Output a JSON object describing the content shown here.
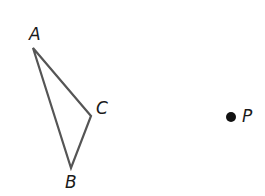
{
  "diagram": {
    "type": "geometry",
    "triangle": {
      "name": "triangle-ABC",
      "vertices": [
        {
          "label": "A",
          "x": 33,
          "y": 48
        },
        {
          "label": "B",
          "x": 71,
          "y": 168
        },
        {
          "label": "C",
          "x": 91,
          "y": 116
        }
      ],
      "stroke_color": "#555555"
    },
    "point": {
      "label": "P",
      "x": 231,
      "y": 117,
      "fill_color": "#111111"
    },
    "labels": {
      "A": "A",
      "B": "B",
      "C": "C",
      "P": "P"
    }
  }
}
